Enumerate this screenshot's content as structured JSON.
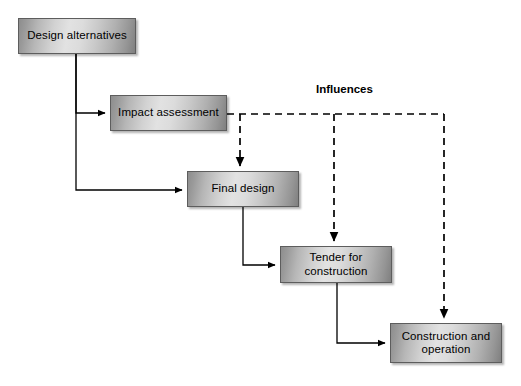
{
  "diagram": {
    "background_color": "#ffffff",
    "nodes": [
      {
        "id": "design-alternatives",
        "label": "Design alternatives",
        "x": 18,
        "y": 18,
        "w": 118,
        "h": 36
      },
      {
        "id": "impact-assessment",
        "label": "Impact assessment",
        "x": 110,
        "y": 95,
        "w": 117,
        "h": 36
      },
      {
        "id": "final-design",
        "label": "Final design",
        "x": 187,
        "y": 171,
        "w": 112,
        "h": 36
      },
      {
        "id": "tender-for-construction",
        "label": "Tender for\nconstruction",
        "line1": "Tender for",
        "line2": "construction",
        "x": 280,
        "y": 246,
        "w": 112,
        "h": 37
      },
      {
        "id": "construction-and-operation",
        "label": "Construction and\noperation",
        "line1": "Construction and",
        "line2": "operation",
        "x": 390,
        "y": 323,
        "w": 112,
        "h": 40
      }
    ],
    "labels": [
      {
        "id": "influences",
        "text": "Influences",
        "x": 316,
        "y": 83
      }
    ],
    "edges": [
      {
        "id": "design-to-impact",
        "from": "design-alternatives",
        "to": "impact-assessment",
        "style": "solid",
        "color": "#000000"
      },
      {
        "id": "design-to-final-design",
        "from": "design-alternatives",
        "to": "final-design",
        "style": "solid",
        "color": "#000000"
      },
      {
        "id": "final-design-to-tender",
        "from": "final-design",
        "to": "tender-for-construction",
        "style": "solid",
        "color": "#000000"
      },
      {
        "id": "tender-to-construction",
        "from": "tender-for-construction",
        "to": "construction-and-operation",
        "style": "solid",
        "color": "#000000"
      },
      {
        "id": "influence-impact-to-final-design",
        "from": "impact-assessment",
        "to": "final-design",
        "style": "dashed",
        "color": "#000000",
        "group": "influences"
      },
      {
        "id": "influence-impact-to-tender",
        "from": "impact-assessment",
        "to": "tender-for-construction",
        "style": "dashed",
        "color": "#000000",
        "group": "influences"
      },
      {
        "id": "influence-impact-to-construction",
        "from": "impact-assessment",
        "to": "construction-and-operation",
        "style": "dashed",
        "color": "#000000",
        "group": "influences"
      }
    ]
  }
}
